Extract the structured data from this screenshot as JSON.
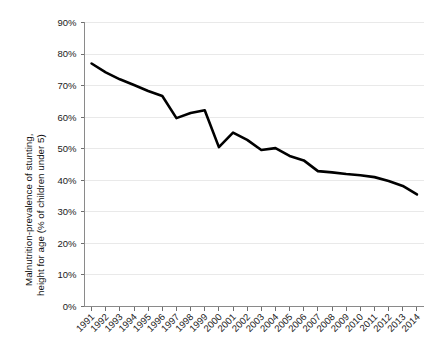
{
  "chart_data": {
    "type": "line",
    "title": "",
    "xlabel": "",
    "ylabel": "Malnutrition-prevalence of stunting, height for age (% of children under 5)",
    "ylabel_line1": "Malnutrition-prevalence of stunting,",
    "ylabel_line2": "height for age (% of children under 5)",
    "ylim": [
      0,
      90
    ],
    "grid": true,
    "legend": "none",
    "line_color": "#000000",
    "grid_color": "#e9e9e9",
    "axis_color": "#8a8a8a",
    "categories": [
      "1991",
      "1992",
      "1993",
      "1994",
      "1995",
      "1996",
      "1997",
      "1998",
      "1999",
      "2000",
      "2001",
      "2002",
      "2003",
      "2004",
      "2005",
      "2006",
      "2007",
      "2008",
      "2009",
      "2010",
      "2011",
      "2012",
      "2013",
      "2014"
    ],
    "x": [
      1991,
      1992,
      1993,
      1994,
      1995,
      1996,
      1997,
      1998,
      1999,
      2000,
      2001,
      2002,
      2003,
      2004,
      2005,
      2006,
      2007,
      2008,
      2009,
      2010,
      2011,
      2012,
      2013,
      2014
    ],
    "values": [
      77.0,
      74.2,
      72.0,
      70.2,
      68.3,
      66.7,
      59.7,
      61.3,
      62.2,
      50.5,
      55.1,
      52.8,
      49.6,
      50.2,
      47.7,
      46.3,
      42.9,
      42.5,
      42.0,
      41.6,
      41.0,
      39.8,
      38.2,
      35.5
    ],
    "yticks": [
      0,
      10,
      20,
      30,
      40,
      50,
      60,
      70,
      80,
      90
    ],
    "ytick_labels": [
      "0%",
      "10%",
      "20%",
      "30%",
      "40%",
      "50%",
      "60%",
      "70%",
      "80%",
      "90%"
    ]
  }
}
